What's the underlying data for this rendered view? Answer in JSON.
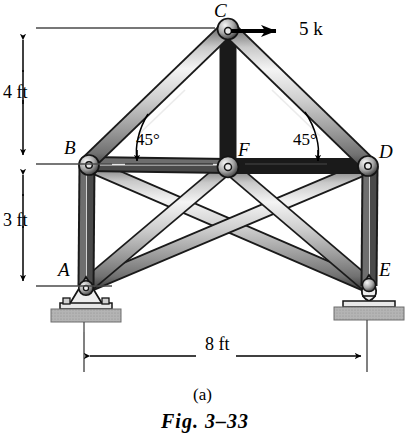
{
  "figure": {
    "caption_part": "(a)",
    "caption_main": "Fig. 3–33",
    "background": "#ffffff",
    "ink": "#000000",
    "member_light": "#f2f2f2",
    "member_mid": "#9a9a9a",
    "member_dark": "#3d3d3d",
    "ground_fill": "#a9a9a9"
  },
  "joints": [
    {
      "id": "C",
      "label": "C",
      "x": 228,
      "y": 28,
      "label_x": 216,
      "label_y": 2,
      "type": "pin-joint"
    },
    {
      "id": "B",
      "label": "B",
      "x": 87,
      "y": 164,
      "label_x": 66,
      "label_y": 139,
      "type": "pin-joint"
    },
    {
      "id": "F",
      "label": "F",
      "x": 228,
      "y": 166,
      "label_x": 238,
      "label_y": 141,
      "type": "pin-joint"
    },
    {
      "id": "D",
      "label": "D",
      "x": 370,
      "y": 166,
      "label_x": 380,
      "label_y": 143,
      "type": "pin-joint"
    },
    {
      "id": "A",
      "label": "A",
      "x": 86,
      "y": 286,
      "label_x": 60,
      "label_y": 261,
      "type": "pin-support"
    },
    {
      "id": "E",
      "label": "E",
      "x": 369,
      "y": 286,
      "label_x": 380,
      "label_y": 261,
      "type": "roller-support"
    }
  ],
  "members": [
    {
      "name": "member-CB",
      "from": "C",
      "to": "B"
    },
    {
      "name": "member-CD",
      "from": "C",
      "to": "D"
    },
    {
      "name": "member-CF",
      "from": "C",
      "to": "F"
    },
    {
      "name": "member-BF",
      "from": "B",
      "to": "F"
    },
    {
      "name": "member-FD",
      "from": "F",
      "to": "D"
    },
    {
      "name": "member-BA",
      "from": "B",
      "to": "A"
    },
    {
      "name": "member-DE",
      "from": "D",
      "to": "E"
    },
    {
      "name": "member-BE",
      "from": "B",
      "to": "E"
    },
    {
      "name": "member-DA",
      "from": "D",
      "to": "A"
    },
    {
      "name": "member-FA",
      "from": "F",
      "to": "A"
    },
    {
      "name": "member-FE",
      "from": "F",
      "to": "E"
    }
  ],
  "load": {
    "label": "5 k",
    "magnitude": 5,
    "unit": "k",
    "applied_at": "C",
    "direction": "right",
    "arrow_x1": 231,
    "arrow_x2": 291,
    "arrow_y": 31,
    "label_x": 299,
    "label_y": 18
  },
  "angles": [
    {
      "label": "45°",
      "at": "B",
      "label_x": 136,
      "label_y": 131
    },
    {
      "label": "45°",
      "at": "D",
      "label_x": 294,
      "label_y": 131
    }
  ],
  "dimensions": [
    {
      "name": "vertical-4ft",
      "label": "4 ft",
      "value": 4,
      "unit": "ft",
      "orient": "vertical",
      "x": 23,
      "y1": 28,
      "y2": 160,
      "label_x": 4,
      "label_y": 82
    },
    {
      "name": "vertical-3ft",
      "label": "3 ft",
      "value": 3,
      "unit": "ft",
      "orient": "vertical",
      "x": 23,
      "y1": 166,
      "y2": 286,
      "label_x": 4,
      "label_y": 210
    },
    {
      "name": "horizontal-8ft",
      "label": "8 ft",
      "value": 8,
      "unit": "ft",
      "orient": "horizontal",
      "y": 356,
      "x1": 84,
      "x2": 367,
      "label_x": 204,
      "label_y": 340
    }
  ],
  "supports": {
    "pin": {
      "at": "A",
      "description": "pinned-support-with-base-plate"
    },
    "roller": {
      "at": "E",
      "description": "roller-support-on-base-plate"
    }
  }
}
